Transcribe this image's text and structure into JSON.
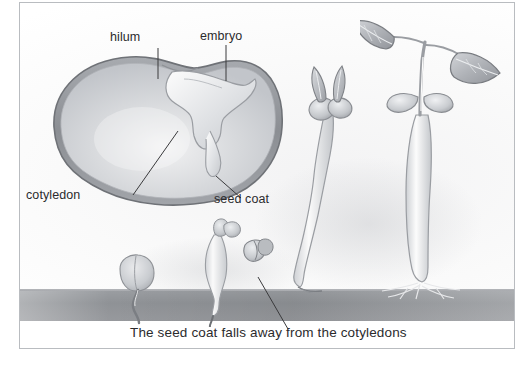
{
  "figure": {
    "clipped_header_text": "",
    "caption": "The seed coat falls away from the cotyledons",
    "background_color": "#ffffff",
    "border_color": "#b9bcc0",
    "text_color": "#2b2b2d",
    "soil_color": "#92959a",
    "seed_coat_color": "#8e9196",
    "cotyledon_color": "#c9cbcf"
  },
  "labels": {
    "hilum": "hilum",
    "embryo": "embryo",
    "cotyledon": "cotyledon",
    "seed_coat": "seed coat"
  },
  "diagram": {
    "title_implicit": "Bean seed structure and germination",
    "parts": [
      {
        "name": "hilum",
        "label": "hilum"
      },
      {
        "name": "embryo",
        "label": "embryo"
      },
      {
        "name": "cotyledon",
        "label": "cotyledon"
      },
      {
        "name": "seed-coat",
        "label": "seed coat"
      }
    ],
    "stages": [
      {
        "index": 1,
        "name": "germinating-seed",
        "description": "seed with emerging radicle at soil surface"
      },
      {
        "index": 2,
        "name": "hypocotyl-emerging",
        "description": "hypocotyl arching up, seed coat splitting away"
      },
      {
        "index": 3,
        "name": "seedling-cotyledons",
        "description": "tall seedling with cotyledons and first leaves"
      },
      {
        "index": 4,
        "name": "mature-seedling",
        "description": "seedling with true leaves and root system"
      }
    ]
  }
}
